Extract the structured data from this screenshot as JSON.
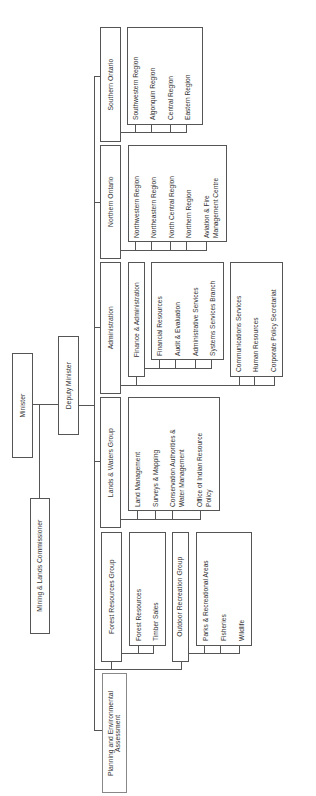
{
  "chart_title": "",
  "orientation": "rotated 90 degrees counter-clockwise",
  "root": {
    "minister": "Minister",
    "deputy_minister": "Deputy Minister",
    "mining_lands_commissioner": "Mining & Lands Commissioner"
  },
  "divisions": {
    "southern_ontario": {
      "label": "Southern Ontario",
      "units": [
        "Southwestern Region",
        "Algonquin Region",
        "Central Region",
        "Eastern Region"
      ]
    },
    "northern_ontario": {
      "label": "Northern Ontario",
      "units": [
        "Northwestern Region",
        "Northeastern Region",
        "North Central Region",
        "Northern Region",
        "Aviation & Fire",
        "Management Centre"
      ]
    },
    "administration": {
      "label": "Administration",
      "finance_admin": "Finance & Administration",
      "finance_units": [
        "Financial Resources",
        "Audit & Evaluation",
        "Administrative Services",
        "Systems Services Branch"
      ],
      "other_units": [
        "Communications Services",
        "Human Resources",
        "Corporate Policy Secretariat"
      ]
    },
    "lands_waters": {
      "label": "Lands & Waters Group",
      "units": [
        "Land Management",
        "Surveys & Mapping",
        "Conservation Authorities &",
        "Water Management",
        "Office of Indian Resource",
        "Policy"
      ]
    },
    "forest_resources": {
      "label": "Forest Resources Group",
      "units": [
        "Forest Resources",
        "Timber Sales"
      ]
    },
    "outdoor_recreation": {
      "label": "Outdoor Recreation Group",
      "units": [
        "Parks & Recreational Areas",
        "Fisheries",
        "Wildlife"
      ]
    },
    "planning": {
      "line1": "Planning and Environmental",
      "line2": "Assessment"
    }
  }
}
